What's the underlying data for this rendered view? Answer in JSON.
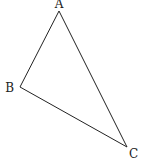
{
  "diagram": {
    "type": "triangle",
    "vertices": [
      {
        "label": "A",
        "x": 59,
        "y": 11,
        "label_x": 59,
        "label_y": 8,
        "anchor": "middle"
      },
      {
        "label": "B",
        "x": 20,
        "y": 87,
        "label_x": 14,
        "label_y": 91,
        "anchor": "end"
      },
      {
        "label": "C",
        "x": 127,
        "y": 147,
        "label_x": 129,
        "label_y": 157,
        "anchor": "start"
      }
    ],
    "edges": [
      [
        "A",
        "B"
      ],
      [
        "B",
        "C"
      ],
      [
        "C",
        "A"
      ]
    ],
    "stroke_color": "#222222",
    "background": "#ffffff"
  }
}
